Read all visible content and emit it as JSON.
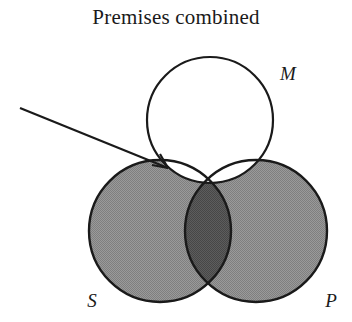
{
  "title": "Premises combined",
  "diagram": {
    "type": "venn-three-circle",
    "labels": {
      "m": "M",
      "s": "S",
      "p": "P"
    },
    "colors": {
      "stroke": "#1a1a1a",
      "background": "#ffffff",
      "shade_light": "#8e8e8e",
      "shade_dark": "#555555"
    },
    "circles": {
      "m": {
        "cx": 210,
        "cy": 120,
        "r": 63
      },
      "s": {
        "cx": 160,
        "cy": 231,
        "r": 71
      },
      "p": {
        "cx": 256,
        "cy": 231,
        "r": 71
      }
    },
    "label_positions": {
      "m": {
        "x": 288,
        "y": 80
      },
      "s": {
        "x": 92,
        "y": 307
      },
      "p": {
        "x": 331,
        "y": 307
      }
    },
    "shading": {
      "s_only": "shade_light",
      "p_only": "shade_light",
      "s_and_p_outside_m": "shade_dark",
      "inside_m": "background"
    },
    "arrow": {
      "x1": 20,
      "y1": 108,
      "x2": 168,
      "y2": 168
    }
  }
}
